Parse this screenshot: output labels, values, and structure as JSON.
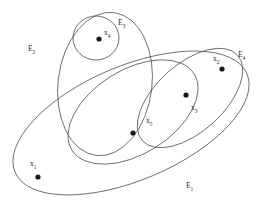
{
  "diagram": {
    "type": "venn-euler-diagram",
    "title": "",
    "background_color": "#ffffff",
    "stroke_color": "#4a4a4a",
    "dot_color": "#1a1a1a",
    "sets": [
      {
        "id": "E1",
        "label": "E",
        "subscript": "1",
        "shape": "ellipse",
        "cx": 131,
        "cy": 123,
        "rx": 126,
        "ry": 57,
        "rotation": -23,
        "label_x": 186,
        "label_y": 182
      },
      {
        "id": "E2",
        "label": "E",
        "subscript": "2",
        "shape": "ellipse",
        "cx": 105,
        "cy": 84,
        "rx": 47,
        "ry": 72,
        "rotation": 7,
        "label_x": 28,
        "label_y": 45
      },
      {
        "id": "E3",
        "label": "E",
        "subscript": "3",
        "shape": "circle",
        "cx": 96,
        "cy": 38,
        "rx": 23,
        "ry": 22,
        "rotation": 0,
        "label_x": 118,
        "label_y": 19
      },
      {
        "id": "E4",
        "label": "E",
        "subscript": "4",
        "shape": "ellipse",
        "cx": 190,
        "cy": 98,
        "rx": 64,
        "ry": 34,
        "rotation": -42,
        "label_x": 238,
        "label_y": 51
      },
      {
        "id": "E5",
        "label": "",
        "subscript": "",
        "shape": "ellipse",
        "cx": 133,
        "cy": 112,
        "rx": 72,
        "ry": 42,
        "rotation": -32,
        "label_x": 0,
        "label_y": 0
      }
    ],
    "elements": [
      {
        "id": "x1",
        "label": "x",
        "subscript": "1",
        "dot_x": 38,
        "dot_y": 177,
        "label_x": 30,
        "label_y": 160
      },
      {
        "id": "x2",
        "label": "x",
        "subscript": "2",
        "dot_x": 222,
        "dot_y": 69,
        "label_x": 213,
        "label_y": 55
      },
      {
        "id": "x3",
        "label": "x",
        "subscript": "3",
        "dot_x": 186,
        "dot_y": 95,
        "label_x": 191,
        "label_y": 104
      },
      {
        "id": "x4",
        "label": "x",
        "subscript": "4",
        "dot_x": 99,
        "dot_y": 39,
        "label_x": 104,
        "label_y": 29
      },
      {
        "id": "x5",
        "label": "x",
        "subscript": "5",
        "dot_x": 133,
        "dot_y": 133,
        "label_x": 146,
        "label_y": 117
      }
    ]
  }
}
